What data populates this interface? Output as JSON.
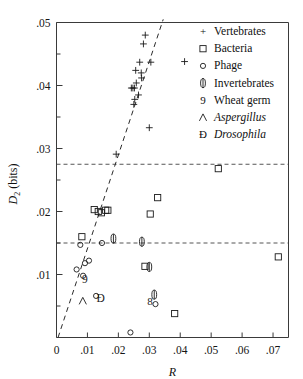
{
  "chart_data": {
    "type": "scatter",
    "title": "",
    "xlabel": "R",
    "ylabel": "D2 (bits)",
    "ylabel_base": "D",
    "ylabel_sub": "2",
    "ylabel_unit": " (bits)",
    "xlim": [
      0,
      0.075
    ],
    "ylim": [
      0,
      0.05
    ],
    "grid": false,
    "xticks": [
      0,
      0.01,
      0.02,
      0.03,
      0.04,
      0.05,
      0.06,
      0.07
    ],
    "xtick_labels": [
      "0",
      ".01",
      ".02",
      ".03",
      ".04",
      ".05",
      ".06",
      ".07"
    ],
    "yticks": [
      0.01,
      0.02,
      0.03,
      0.04,
      0.05
    ],
    "ytick_labels": [
      ".01",
      ".02",
      ".03",
      ".04",
      ".05"
    ],
    "yticks_minor": [
      0.005,
      0.015,
      0.025,
      0.035,
      0.045
    ],
    "legend_position": "top-right",
    "reference_lines": [
      {
        "name": "upper-reference",
        "y": 0.0275
      },
      {
        "name": "lower-reference",
        "y": 0.015
      }
    ],
    "trend_line": {
      "name": "regression-line",
      "x1": 0.0005,
      "y1": 0.0,
      "x2": 0.0345,
      "y2": 0.0505,
      "style": "dashed"
    },
    "series": [
      {
        "name": "Vertebrates",
        "marker": "plus",
        "points": [
          [
            0.0287,
            0.048
          ],
          [
            0.0281,
            0.0466
          ],
          [
            0.0305,
            0.0437
          ],
          [
            0.0269,
            0.0437
          ],
          [
            0.0256,
            0.0424
          ],
          [
            0.0274,
            0.042
          ],
          [
            0.0275,
            0.0412
          ],
          [
            0.0258,
            0.0404
          ],
          [
            0.0242,
            0.0396
          ],
          [
            0.0247,
            0.0396
          ],
          [
            0.0252,
            0.0396
          ],
          [
            0.0265,
            0.0385
          ],
          [
            0.0253,
            0.0378
          ],
          [
            0.025,
            0.037
          ],
          [
            0.0414,
            0.0438
          ],
          [
            0.03,
            0.0333
          ],
          [
            0.0193,
            0.0291
          ]
        ]
      },
      {
        "name": "Bacteria",
        "marker": "square",
        "points": [
          [
            0.0122,
            0.0203
          ],
          [
            0.0135,
            0.02
          ],
          [
            0.0145,
            0.0198
          ],
          [
            0.0159,
            0.0202
          ],
          [
            0.0166,
            0.0202
          ],
          [
            0.0327,
            0.0222
          ],
          [
            0.0303,
            0.0196
          ],
          [
            0.0082,
            0.016
          ],
          [
            0.0286,
            0.0113
          ],
          [
            0.0717,
            0.0128
          ],
          [
            0.0523,
            0.0268
          ],
          [
            0.0382,
            0.0038
          ]
        ]
      },
      {
        "name": "Phage",
        "marker": "circle",
        "points": [
          [
            0.0077,
            0.0147
          ],
          [
            0.0147,
            0.015
          ],
          [
            0.0105,
            0.0122
          ],
          [
            0.0092,
            0.0118
          ],
          [
            0.0065,
            0.0108
          ],
          [
            0.0086,
            0.0098
          ],
          [
            0.0128,
            0.0066
          ],
          [
            0.032,
            0.0053
          ],
          [
            0.0239,
            0.0008
          ]
        ]
      },
      {
        "name": "Invertebrates",
        "marker": "lens",
        "points": [
          [
            0.0184,
            0.0157
          ],
          [
            0.0276,
            0.0152
          ],
          [
            0.03,
            0.0112
          ],
          [
            0.0316,
            0.0068
          ]
        ]
      },
      {
        "name": "Wheat germ",
        "marker": "nine",
        "points": [
          [
            0.0092,
            0.0091
          ]
        ]
      },
      {
        "name": "Aspergillus",
        "marker": "caret",
        "points": [
          [
            0.0085,
            0.0058
          ]
        ],
        "italic": true
      },
      {
        "name": "Drosophila",
        "marker": "eth",
        "points": [
          [
            0.0143,
            0.006
          ]
        ],
        "italic": true
      },
      {
        "name": "Yeast-pair",
        "marker": "eight",
        "points": [
          [
            0.0302,
            0.0055
          ]
        ],
        "hidden_from_legend": true
      }
    ],
    "legend": [
      {
        "label": "Vertebrates",
        "glyph": "+",
        "italic": false
      },
      {
        "label": "Bacteria",
        "glyph": "square",
        "italic": false
      },
      {
        "label": "Phage",
        "glyph": "circle",
        "italic": false
      },
      {
        "label": "Invertebrates",
        "glyph": "lens",
        "italic": false
      },
      {
        "label": "Wheat germ",
        "glyph": "9",
        "italic": false
      },
      {
        "label": "Aspergillus",
        "glyph": "caret",
        "italic": true
      },
      {
        "label": "Drosophila",
        "glyph": "eth",
        "italic": true
      }
    ]
  }
}
